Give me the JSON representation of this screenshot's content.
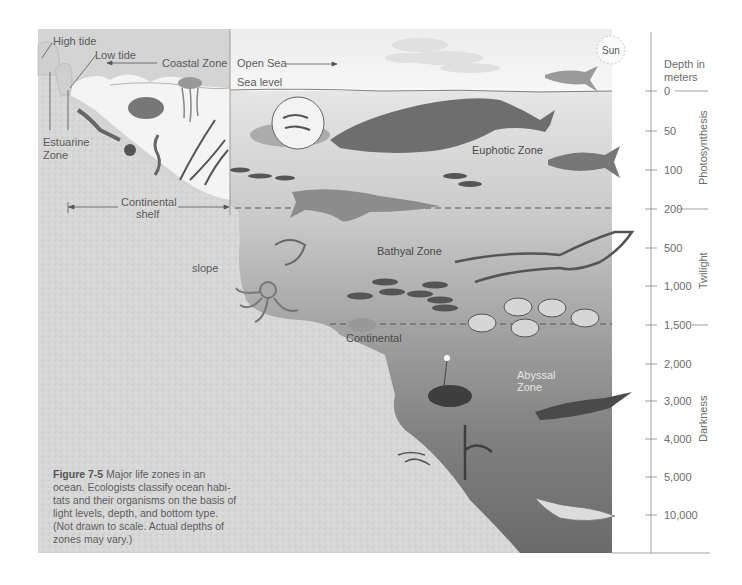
{
  "figure": {
    "number": "Figure 7-5",
    "caption": "Major life zones in an ocean. Ecologists classify ocean habitats and their organisms on the basis of light levels, depth, and bottom type. (Not drawn to scale. Actual depths of zones may vary.)",
    "caption_lines": [
      "Major life zones in an",
      "ocean. Ecologists classify ocean habi-",
      "tats and their organisms on the basis of",
      "light levels, depth, and bottom type.",
      "(Not drawn to scale. Actual depths of",
      "zones may vary.)"
    ]
  },
  "labels": {
    "high_tide": "High tide",
    "low_tide": "Low tide",
    "coastal_zone": "Coastal Zone",
    "open_sea": "Open Sea",
    "sea_level": "Sea level",
    "sun": "Sun",
    "estuarine_zone_line1": "Estuarine",
    "estuarine_zone_line2": "Zone",
    "continental_shelf_line1": "Continental",
    "continental_shelf_line2": "shelf",
    "slope": "slope",
    "continental_rise": "Continental",
    "euphotic_zone": "Euphotic Zone",
    "bathyal_zone": "Bathyal Zone",
    "abyssal_zone_line1": "Abyssal",
    "abyssal_zone_line2": "Zone"
  },
  "depth_axis": {
    "title_line1": "Depth in",
    "title_line2": "meters",
    "ticks": [
      "0",
      "50",
      "100",
      "200",
      "500",
      "1,000",
      "1,500",
      "2,000",
      "3,000",
      "4,000",
      "5,000",
      "10,000"
    ],
    "light_bands": [
      {
        "name": "Photosynthesis",
        "range": "0-200"
      },
      {
        "name": "Twilight",
        "range": "200-1,500"
      },
      {
        "name": "Darkness",
        "range": "1,500-10,000"
      }
    ]
  },
  "colors": {
    "sky": "#f2f2f2",
    "coastal_sky": "#d2d2d2",
    "water_top": "#e4e4e4",
    "water_mid": "#a8a8a8",
    "water_deep": "#6e6e6e",
    "seafloor": "#d6d6d6",
    "text": "#5a5a5a"
  }
}
